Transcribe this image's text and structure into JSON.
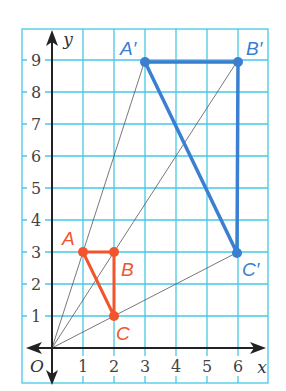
{
  "figure": {
    "x_axis_label": "x",
    "y_axis_label": "y",
    "origin_label": "O",
    "x_ticks": [
      "1",
      "2",
      "3",
      "4",
      "5",
      "6"
    ],
    "y_ticks": [
      "1",
      "2",
      "3",
      "4",
      "5",
      "6",
      "7",
      "8",
      "9"
    ],
    "colors": {
      "grid": "#45c8e6",
      "original": "#f2552c",
      "image": "#3a7fd0",
      "axis": "#222222",
      "rays": "#555555"
    },
    "original_triangle": {
      "points": [
        {
          "label": "A",
          "x": 1,
          "y": 3
        },
        {
          "label": "B",
          "x": 2,
          "y": 3
        },
        {
          "label": "C",
          "x": 2,
          "y": 1
        }
      ]
    },
    "image_triangle": {
      "points": [
        {
          "label": "A′",
          "x": 3,
          "y": 9
        },
        {
          "label": "B′",
          "x": 6,
          "y": 9
        },
        {
          "label": "C′",
          "x": 6,
          "y": 3
        }
      ]
    }
  }
}
